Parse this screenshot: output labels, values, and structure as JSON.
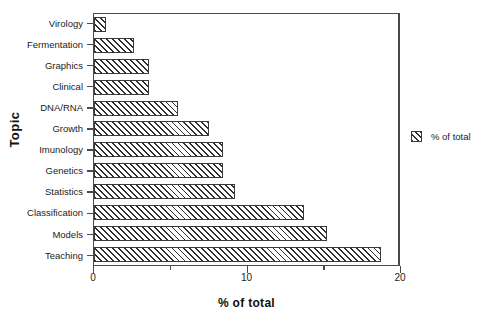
{
  "chart_data": {
    "type": "bar",
    "orientation": "horizontal",
    "title": "",
    "xlabel": "% of total",
    "ylabel": "Topic",
    "xlim": [
      0,
      20
    ],
    "grid": false,
    "legend_position": "right",
    "x_major_ticks": [
      0,
      10,
      20
    ],
    "x_minor_ticks": [
      5,
      15
    ],
    "x_tick_labels": [
      "0",
      "10",
      "20"
    ],
    "legend": [
      {
        "name": "% of total",
        "pattern": "diagonal-hatch"
      }
    ],
    "categories": [
      "Virology",
      "Fermentation",
      "Graphics",
      "Clinical",
      "DNA/RNA",
      "Growth",
      "Imunology",
      "Genetics",
      "Statistics",
      "Classification",
      "Models",
      "Teaching"
    ],
    "series": [
      {
        "name": "% of total",
        "values": [
          0.8,
          2.6,
          3.6,
          3.6,
          5.5,
          7.5,
          8.4,
          8.4,
          9.2,
          13.7,
          15.2,
          18.7
        ]
      }
    ]
  },
  "legend": {
    "entry_label": "% of total"
  },
  "axes": {
    "y_title": "Topic",
    "x_title": "% of total"
  }
}
